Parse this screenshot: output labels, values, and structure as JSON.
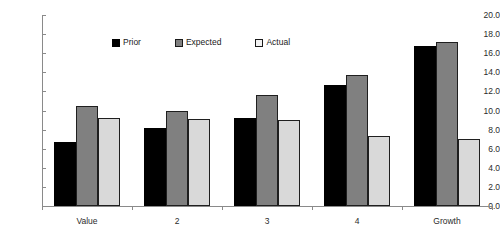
{
  "chart_data": {
    "type": "bar",
    "title": "",
    "subtitle": "",
    "xlabel": "",
    "ylabel": "",
    "categories": [
      "Value",
      "2",
      "3",
      "4",
      "Growth"
    ],
    "series": [
      {
        "name": "Prior",
        "color": "#000000",
        "values": [
          6.7,
          8.2,
          9.2,
          12.7,
          16.8
        ]
      },
      {
        "name": "Expected",
        "color": "#808080",
        "values": [
          10.5,
          9.9,
          11.6,
          13.7,
          17.2
        ]
      },
      {
        "name": "Actual",
        "color": "#d9d9d9",
        "values": [
          9.2,
          9.1,
          9.0,
          7.3,
          7.0
        ]
      }
    ],
    "ylim": [
      0.0,
      20.0
    ],
    "ytick_step": 2.0,
    "yticks": [
      "0.0",
      "2.0",
      "4.0",
      "6.0",
      "8.0",
      "10.0",
      "12.0",
      "14.0",
      "16.0",
      "18.0",
      "20.0"
    ],
    "grid": false,
    "legend_position": "top-center",
    "axis_color": "#8a8a8a",
    "background": "#ffffff"
  }
}
